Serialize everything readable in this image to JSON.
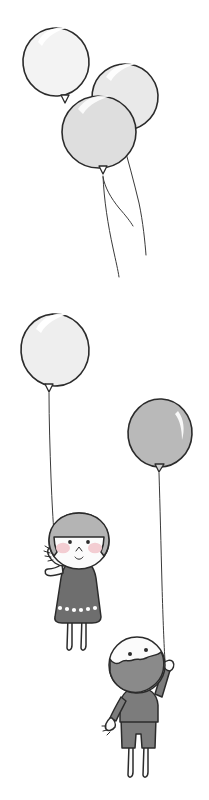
{
  "artwork": {
    "title": "Balloons and Two Children",
    "description": "Hand-drawn line illustration: a cluster of three balloons floating free at the top, and below a girl and a boy each holding a single balloon by a long string.",
    "medium": "pen and gray wash line drawing",
    "background_color": "#ffffff",
    "ink_color": "#2b2b2b",
    "canvas": {
      "width": 209,
      "height": 800
    }
  },
  "palette": {
    "ink": "#2b2b2b",
    "string": "#3a3a3a",
    "balloon_white": "#f7f7f7",
    "balloon_pale": "#efefef",
    "balloon_light": "#e4e4e4",
    "balloon_mid": "#dcdcdc",
    "balloon_gray": "#b9b9b9",
    "highlight": "#ffffff",
    "skin": "#fbfbfb",
    "hair_gray": "#b4b4b4",
    "dress_gray": "#6e6e6e",
    "shirt_gray": "#7c7c7c",
    "mask_gray": "#8a8a8a",
    "blush_pink": "#f3cdd2",
    "dot_white": "#ffffff"
  },
  "scene": {
    "groups": [
      {
        "name": "floating-balloon-cluster",
        "label": "Cluster of three balloons drifting free",
        "balloon_count": 3,
        "string_count": 3,
        "balloons": [
          {
            "id": "cluster-balloon-back-left",
            "label": "Pale balloon upper left",
            "fill": "#f3f3f3",
            "cx": 56,
            "cy": 62,
            "rx": 33,
            "ry": 34,
            "rotation": -6,
            "knot_x": 65,
            "knot_y": 103
          },
          {
            "id": "cluster-balloon-back-right",
            "label": "Light balloon upper right",
            "fill": "#e9e9e9",
            "cx": 125,
            "cy": 97,
            "rx": 33,
            "ry": 33,
            "rotation": 8,
            "knot_x": 120,
            "knot_y": 136
          },
          {
            "id": "cluster-balloon-front",
            "label": "Gray balloon front center",
            "fill": "#dedede",
            "cx": 99,
            "cy": 132,
            "rx": 37,
            "ry": 36,
            "rotation": 0,
            "knot_x": 103,
            "knot_y": 173
          }
        ],
        "strings": [
          {
            "id": "cluster-string-1",
            "ends_at_y": 277
          },
          {
            "id": "cluster-string-2",
            "ends_at_y": 226
          },
          {
            "id": "cluster-string-3",
            "ends_at_y": 255
          }
        ]
      },
      {
        "name": "girl-with-balloon",
        "label": "Girl holding a pale balloon",
        "balloon": {
          "id": "girl-balloon",
          "label": "Pale balloon held by the girl",
          "fill": "#eeeeee",
          "cx": 55,
          "cy": 350,
          "rx": 34,
          "ry": 36,
          "rotation": -4,
          "knot_x": 49,
          "knot_y": 390
        },
        "string": {
          "id": "girl-balloon-string",
          "from_y": 393,
          "to_y": 533
        },
        "character": {
          "id": "girl",
          "label": "Girl in a dotted dress waving",
          "hair_style": "bob",
          "hair_color": "#b4b4b4",
          "skin_color": "#fbfbfb",
          "outfit": "dotted dress",
          "outfit_color": "#6e6e6e",
          "dress_dot_color": "#ffffff",
          "dress_dot_count": 7,
          "blush_color": "#f3cdd2",
          "expression": "smiling",
          "eyes": "two dots",
          "nose": "small caret",
          "mouth": "small u-curve smile",
          "pose": "right arm raised holding the balloon string, left arm across the body",
          "leg_count": 2
        }
      },
      {
        "name": "boy-with-balloon",
        "label": "Boy holding a gray balloon",
        "balloon": {
          "id": "boy-balloon",
          "label": "Gray balloon held by the boy",
          "fill": "#b9b9b9",
          "cx": 160,
          "cy": 433,
          "rx": 32,
          "ry": 34,
          "rotation": 3,
          "knot_x": 158,
          "knot_y": 470
        },
        "string": {
          "id": "boy-balloon-string",
          "from_y": 473,
          "to_y": 660
        },
        "character": {
          "id": "boy",
          "label": "Boy in a gray shirt reaching up",
          "hair_style": "round cap with wavy lower edge",
          "hair_color": "#8a8a8a",
          "skin_color": "#fbfbfb",
          "outfit": "gray shirt and shorts",
          "outfit_color": "#7c7c7c",
          "expression": "neutral",
          "eyes": "two dots",
          "pose": "right arm stretched up holding the string, left arm hanging down",
          "leg_count": 2
        }
      }
    ]
  }
}
